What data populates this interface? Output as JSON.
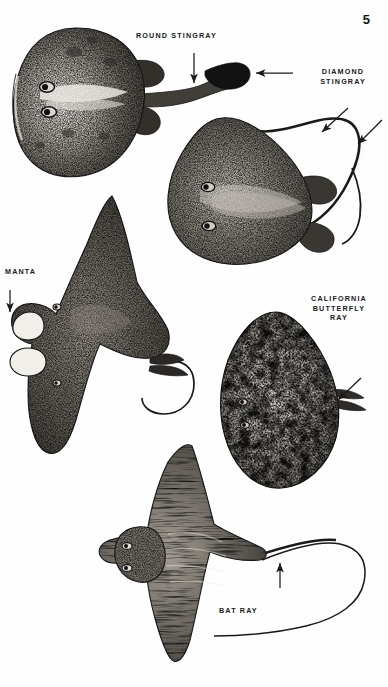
{
  "page": {
    "number": "5",
    "kind": "illustration-plate",
    "background_color": "#fefefe",
    "ink_color": "#1a1a1a"
  },
  "labels": {
    "round_stingray": "ROUND STINGRAY",
    "diamond_stingray": "DIAMOND\nSTINGRAY",
    "manta": "MANTA",
    "california_butterfly_ray": "CALIFORNIA\nBUTTERFLY\nRAY",
    "bat_ray": "BAT RAY"
  },
  "figures": [
    {
      "id": "round-stingray",
      "common_name": "ROUND STINGRAY",
      "description": "Rounded disc-shaped ray, dorsal view, head to the left, short thick tail extending right with a dark bulbous caudal fin.",
      "arrows": [
        {
          "name": "sting-arrow",
          "direction": "down",
          "points_to": "tail sting / barb"
        },
        {
          "name": "caudal-fin-arrow",
          "direction": "left",
          "points_to": "caudal fin"
        }
      ]
    },
    {
      "id": "diamond-stingray",
      "common_name": "DIAMOND STINGRAY",
      "description": "Angular diamond-shaped disc, dorsal view, head to the left, long whip-like tail sweeping up and over to the right.",
      "arrows": [
        {
          "name": "tail-fold-arrow",
          "direction": "down-left",
          "points_to": "tail fold"
        },
        {
          "name": "sting-arrow",
          "direction": "down-left",
          "points_to": "tail sting"
        }
      ]
    },
    {
      "id": "manta",
      "common_name": "MANTA",
      "description": "Large winged ray with broad pointed pectoral wings and a pair of pale cephalic head lobes at left; slender curled tail at right.",
      "arrows": [
        {
          "name": "cephalic-fin-arrow",
          "direction": "down",
          "points_to": "cephalic head fin"
        }
      ]
    },
    {
      "id": "california-butterfly-ray",
      "common_name": "CALIFORNIA BUTTERFLY RAY",
      "description": "Broad mottled kite-shaped disc with heavy light-and-dark blotching and a very short stubby tail at right.",
      "arrows": [
        {
          "name": "short-tail-arrow",
          "direction": "down-left",
          "points_to": "short tail"
        }
      ]
    },
    {
      "id": "bat-ray",
      "common_name": "BAT RAY",
      "description": "Ray with strongly protruding rounded head, banded body, pointed swept wings and a very long whip tail looping to the right.",
      "arrows": [
        {
          "name": "sting-arrow",
          "direction": "up",
          "points_to": "tail sting"
        }
      ]
    }
  ]
}
